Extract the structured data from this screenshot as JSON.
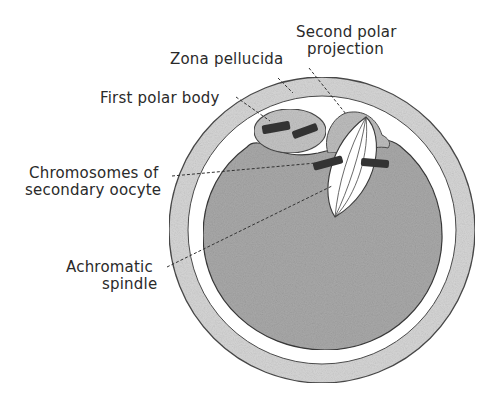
{
  "diagram": {
    "labels": {
      "second_polar_projection": [
        "Second polar",
        "projection"
      ],
      "zona_pellucida": "Zona pellucida",
      "first_polar_body": "First polar body",
      "chromosomes": [
        "Chromosomes of",
        "secondary oocyte"
      ],
      "achromatic_spindle": [
        "Achromatic",
        "spindle"
      ]
    },
    "colors": {
      "zona_fill": "#d6d6d6",
      "cytoplasm_fill": "#a9a9a9",
      "outline": "#4a4a4a",
      "chromosome": "#333333",
      "spindle_fill": "#ffffff",
      "label_text": "#2a2a2a"
    }
  }
}
